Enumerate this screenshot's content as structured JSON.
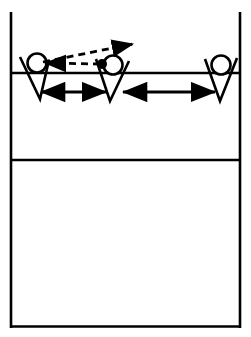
{
  "diagram": {
    "background_color": "#ffffff",
    "stroke_color": "#000000",
    "court": {
      "name": "court-outline",
      "left_sideline_x": 10,
      "right_sideline_x": 241,
      "top_y": 12,
      "bottom_y": 327,
      "attack_line_y": 73,
      "mid_line_y": 160,
      "border_width": 2.6,
      "line_width": 2.6
    },
    "players": [
      {
        "id": "player-left",
        "label": "Left player",
        "head": {
          "cx": 37,
          "cy": 63,
          "r": 9.5
        },
        "arms": {
          "left_x": 20,
          "left_y": 57,
          "apex_x": 40,
          "apex_y": 99,
          "right_x": 49,
          "right_y": 60
        },
        "filled_head": false
      },
      {
        "id": "player-middle",
        "label": "Middle player",
        "head": {
          "cx": 113,
          "cy": 65,
          "r": 9.5
        },
        "arms": {
          "left_x": 96,
          "left_y": 59,
          "apex_x": 110,
          "apex_y": 101,
          "right_x": 129,
          "right_y": 61
        },
        "filled_head": false
      },
      {
        "id": "player-right",
        "label": "Right player",
        "head": {
          "cx": 221,
          "cy": 65,
          "r": 9.5
        },
        "arms": {
          "left_x": 205,
          "left_y": 59,
          "apex_x": 220,
          "apex_y": 101,
          "right_x": 237,
          "right_y": 58
        },
        "filled_head": false
      }
    ],
    "ball": {
      "id": "ball-marker",
      "label": "Ball",
      "cx": 102,
      "cy": 64,
      "r": 5,
      "fill": "#000000"
    },
    "trajectories": [
      {
        "id": "ball-path-up-right",
        "label": "Ball trajectory to upper right",
        "style": "dashed",
        "from_x": 43,
        "from_y": 62,
        "to_x": 133,
        "to_y": 44,
        "arrowheads": "end"
      },
      {
        "id": "ball-path-to-left-player",
        "label": "Ball trajectory toward left player",
        "style": "dashed",
        "from_x": 100,
        "from_y": 64,
        "to_x": 45,
        "to_y": 63,
        "arrowheads": "end"
      }
    ],
    "spacing_arrows": [
      {
        "id": "spacing-left-middle",
        "label": "Spacing between left and middle player",
        "style": "solid",
        "from_x": 41,
        "from_y": 92,
        "to_x": 106,
        "to_y": 92,
        "arrowheads": "both"
      },
      {
        "id": "spacing-middle-right",
        "label": "Spacing between middle and right player",
        "style": "solid",
        "from_x": 123,
        "from_y": 92,
        "to_x": 215,
        "to_y": 92,
        "arrowheads": "both"
      }
    ]
  }
}
